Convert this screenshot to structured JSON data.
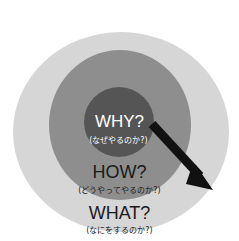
{
  "diagram": {
    "type": "golden-circle",
    "colors": {
      "outer": "#d6d6d6",
      "middle": "#8e8e8e",
      "inner": "#555555",
      "arrow": "#111111",
      "inner_text": "#ffffff",
      "outer_text": "#1a1a1a"
    },
    "rings": [
      {
        "id": "why",
        "label": "WHY?",
        "sublabel": "(なぜやるのか?)"
      },
      {
        "id": "how",
        "label": "HOW?",
        "sublabel": "(どうやってやるのか?)"
      },
      {
        "id": "what",
        "label": "WHAT?",
        "sublabel": "(なにをするのか?)"
      }
    ],
    "arrow": {
      "direction": "from-center-outward"
    }
  }
}
